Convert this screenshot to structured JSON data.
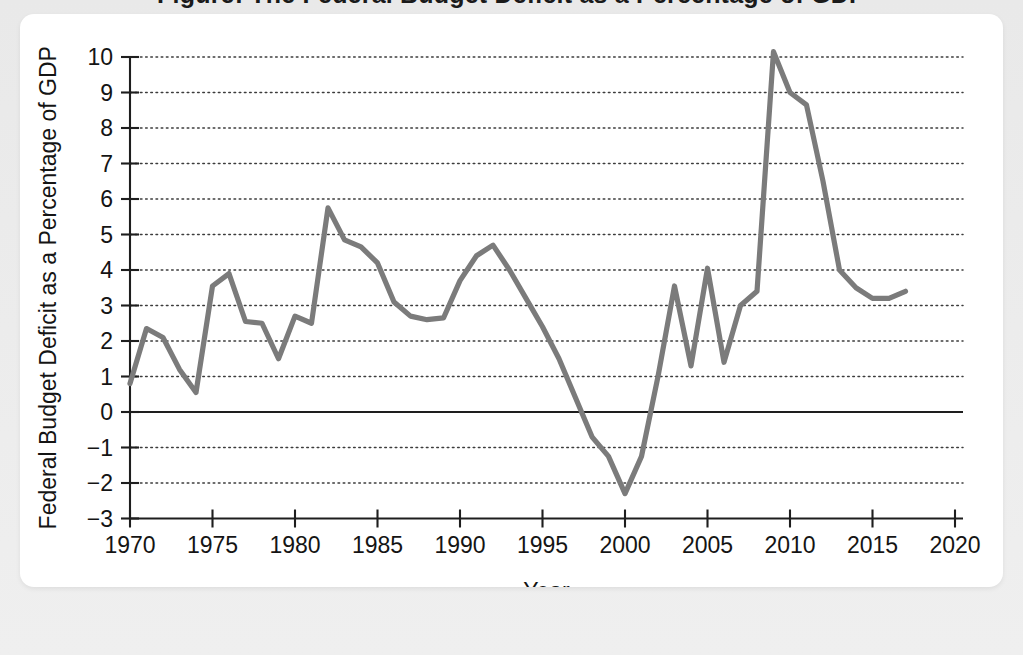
{
  "page": {
    "cropped_title": "Figure: The Federal Budget Deficit as a Percentage of GDP"
  },
  "chart_data": {
    "type": "line",
    "title": "",
    "xlabel": "Year",
    "ylabel": "Federal Budget Deficit as a Percentage of GDP",
    "xlim": [
      1969,
      2021
    ],
    "ylim": [
      -3,
      10
    ],
    "xticks": [
      1970,
      1975,
      1980,
      1985,
      1990,
      1995,
      2000,
      2005,
      2010,
      2015,
      2020
    ],
    "xtick_labels": [
      "1970",
      "1975",
      "1980",
      "1985",
      "1990",
      "1995",
      "2000",
      "2005",
      "2010",
      "2015",
      "2020"
    ],
    "yticks": [
      -3,
      -2,
      -1,
      0,
      1,
      2,
      3,
      4,
      5,
      6,
      7,
      8,
      9,
      10
    ],
    "ytick_labels": [
      "-3",
      "-2",
      "-1",
      "0",
      "1",
      "2",
      "3",
      "4",
      "5",
      "6",
      "7",
      "8",
      "9",
      "10"
    ],
    "grid": true,
    "grid_style": "dotted-horizontal",
    "zero_line": true,
    "legend": null,
    "line_color": "#7b7b7b",
    "x": [
      1970,
      1971,
      1972,
      1973,
      1974,
      1975,
      1976,
      1977,
      1978,
      1979,
      1980,
      1981,
      1982,
      1983,
      1984,
      1985,
      1986,
      1987,
      1988,
      1989,
      1990,
      1991,
      1992,
      1993,
      1994,
      1995,
      1996,
      1997,
      1998,
      1999,
      2000,
      2001,
      2002,
      2003,
      2004,
      2005,
      2006,
      2007,
      2008,
      2009,
      2010,
      2011,
      2012,
      2013,
      2014,
      2015,
      2016,
      2017
    ],
    "values": [
      0.8,
      2.35,
      2.1,
      1.2,
      0.55,
      3.55,
      3.9,
      2.55,
      2.5,
      1.5,
      2.7,
      2.5,
      5.75,
      4.85,
      4.65,
      4.2,
      3.1,
      2.7,
      2.6,
      2.65,
      3.7,
      4.4,
      4.7,
      4.0,
      3.2,
      2.4,
      1.5,
      0.4,
      -0.7,
      -1.25,
      -2.3,
      -1.25,
      1.0,
      3.55,
      1.3,
      4.05,
      1.4,
      3.0,
      3.4,
      10.15,
      9.0,
      8.65,
      6.5,
      4.0,
      3.5,
      3.2,
      3.2,
      3.4
    ]
  }
}
